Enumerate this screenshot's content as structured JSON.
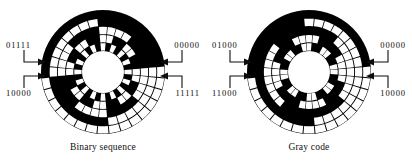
{
  "figure": {
    "background_color": "#ffffff",
    "ink_color": "#0d0d0d",
    "track_on_color": "#000000",
    "track_off_color": "#ffffff"
  },
  "panels": [
    {
      "id": "binary-sequence",
      "caption": "Binary sequence",
      "encoding": "binary",
      "bits": 5,
      "sectors": 32,
      "labels": {
        "top_left": "01111",
        "bottom_left": "10000",
        "top_right": "00000",
        "bottom_right": "11111"
      },
      "codes": [
        "00000",
        "00001",
        "00010",
        "00011",
        "00100",
        "00101",
        "00110",
        "00111",
        "01000",
        "01001",
        "01010",
        "01011",
        "01100",
        "01101",
        "01110",
        "01111",
        "10000",
        "10001",
        "10010",
        "10011",
        "10100",
        "10101",
        "10110",
        "10111",
        "11000",
        "11001",
        "11010",
        "11011",
        "11100",
        "11101",
        "11110",
        "11111"
      ]
    },
    {
      "id": "gray-code",
      "caption": "Gray code",
      "encoding": "gray",
      "bits": 5,
      "sectors": 32,
      "labels": {
        "top_left": "01000",
        "bottom_left": "11000",
        "top_right": "00000",
        "bottom_right": "10000"
      },
      "codes": [
        "00000",
        "00001",
        "00011",
        "00010",
        "00110",
        "00111",
        "00101",
        "00100",
        "01100",
        "01101",
        "01111",
        "01110",
        "01010",
        "01011",
        "01001",
        "01000",
        "11000",
        "11001",
        "11011",
        "11010",
        "11110",
        "11111",
        "11101",
        "11100",
        "10100",
        "10101",
        "10111",
        "10110",
        "10010",
        "10011",
        "10001",
        "10000"
      ]
    }
  ],
  "geometry": {
    "center_x": 64,
    "center_y": 64,
    "outer_radius": 62,
    "hub_radius": 21,
    "ring_count": 5,
    "sector_count": 32
  },
  "icons": {
    "leader_arrow": "arrow-left-icon",
    "leader_arrow_right": "arrow-right-icon"
  }
}
